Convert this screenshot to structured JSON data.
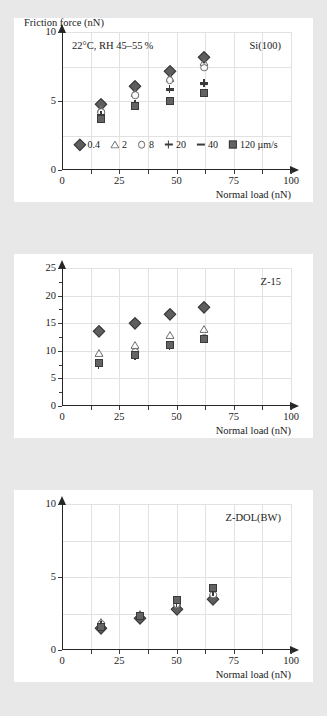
{
  "figure": {
    "background_color": "#e8e8e8",
    "panel_color": "#ffffff",
    "marker_color": "#5e5e5e"
  },
  "legend": {
    "title": "",
    "units": "µm/s",
    "entries": [
      {
        "label": "0.4",
        "marker": "diamond"
      },
      {
        "label": "2",
        "marker": "triangle"
      },
      {
        "label": "8",
        "marker": "circle"
      },
      {
        "label": "20",
        "marker": "plus"
      },
      {
        "label": "40",
        "marker": "dash"
      },
      {
        "label": "120 µm/s",
        "marker": "square"
      }
    ]
  },
  "axis_titles": {
    "y": "Friction force (nN)",
    "x": "Normal load (nN)"
  },
  "chart_data": [
    {
      "type": "scatter",
      "title": "Si(100)",
      "annotation": "22°C, RH 45–55 %",
      "xlabel": "Normal load (nN)",
      "ylabel": "Friction force (nN)",
      "xlim": [
        0,
        100
      ],
      "ylim": [
        0,
        10
      ],
      "xticks": [
        0,
        25,
        50,
        75,
        100
      ],
      "yticks": [
        0,
        5,
        10
      ],
      "grid": true,
      "legend_position": "inside-bottom-center",
      "series": [
        {
          "name": "0.4",
          "marker": "diamond",
          "x": [
            17,
            32,
            47,
            62
          ],
          "y": [
            4.8,
            6.1,
            7.2,
            8.2
          ]
        },
        {
          "name": "2",
          "marker": "triangle",
          "x": [
            17,
            32,
            47,
            62
          ],
          "y": [
            4.4,
            5.6,
            6.7,
            7.8
          ]
        },
        {
          "name": "8",
          "marker": "circle",
          "x": [
            17,
            32,
            47,
            62
          ],
          "y": [
            4.2,
            5.4,
            6.5,
            7.4
          ]
        },
        {
          "name": "20",
          "marker": "plus",
          "x": [
            17,
            32,
            47,
            62
          ],
          "y": [
            4.0,
            4.8,
            5.9,
            6.3
          ]
        },
        {
          "name": "40",
          "marker": "dash",
          "x": [
            17,
            32,
            47,
            62
          ],
          "y": [
            3.9,
            4.7,
            5.8,
            6.2
          ]
        },
        {
          "name": "120",
          "marker": "square",
          "x": [
            17,
            32,
            47,
            62
          ],
          "y": [
            3.7,
            4.65,
            5.0,
            5.6
          ]
        }
      ]
    },
    {
      "type": "scatter",
      "title": "Z-15",
      "annotation": "",
      "xlabel": "Normal load (nN)",
      "ylabel": "Friction force (nN)",
      "xlim": [
        0,
        100
      ],
      "ylim": [
        0,
        25
      ],
      "xticks": [
        0,
        25,
        50,
        75,
        100
      ],
      "yticks": [
        0,
        5,
        10,
        15,
        20,
        25
      ],
      "grid": true,
      "legend_position": "none",
      "series": [
        {
          "name": "0.4",
          "marker": "diamond",
          "x": [
            16,
            32,
            47,
            62
          ],
          "y": [
            13.6,
            15.1,
            16.6,
            18.0
          ]
        },
        {
          "name": "2",
          "marker": "triangle",
          "x": [
            16,
            32,
            47,
            62
          ],
          "y": [
            9.6,
            11.1,
            12.8,
            14.0
          ]
        },
        {
          "name": "8",
          "marker": "circle",
          "x": [
            16,
            32,
            47,
            62
          ],
          "y": [
            7.8,
            9.7,
            11.0,
            12.4
          ]
        },
        {
          "name": "20",
          "marker": "plus",
          "x": [
            16,
            32,
            47,
            62
          ],
          "y": [
            7.5,
            9.1,
            10.9,
            12.1
          ]
        },
        {
          "name": "40",
          "marker": "dash",
          "x": [
            16,
            32,
            47,
            62
          ],
          "y": [
            7.6,
            9.2,
            10.9,
            12.1
          ]
        },
        {
          "name": "120",
          "marker": "square",
          "x": [
            16,
            32,
            47,
            62
          ],
          "y": [
            7.7,
            9.2,
            11.0,
            12.1
          ]
        }
      ]
    },
    {
      "type": "scatter",
      "title": "Z-DOL(BW)",
      "annotation": "",
      "xlabel": "Normal load (nN)",
      "ylabel": "Friction force (nN)",
      "xlim": [
        0,
        100
      ],
      "ylim": [
        0,
        10
      ],
      "xticks": [
        0,
        25,
        50,
        75,
        100
      ],
      "yticks": [
        0,
        5,
        10
      ],
      "grid": true,
      "legend_position": "none",
      "series": [
        {
          "name": "0.4",
          "marker": "diamond",
          "x": [
            17,
            34,
            50,
            66
          ],
          "y": [
            1.5,
            2.2,
            2.8,
            3.5
          ]
        },
        {
          "name": "2",
          "marker": "triangle",
          "x": [
            17,
            34,
            50,
            66
          ],
          "y": [
            1.9,
            2.5,
            3.3,
            3.9
          ]
        },
        {
          "name": "8",
          "marker": "circle",
          "x": [
            17,
            34,
            50,
            66
          ],
          "y": [
            1.8,
            2.3,
            3.1,
            3.8
          ]
        },
        {
          "name": "20",
          "marker": "plus",
          "x": [
            17,
            34,
            50,
            66
          ],
          "y": [
            1.7,
            2.35,
            3.25,
            4.0
          ]
        },
        {
          "name": "40",
          "marker": "dash",
          "x": [
            17,
            34,
            50,
            66
          ],
          "y": [
            1.65,
            2.55,
            3.45,
            4.2
          ]
        },
        {
          "name": "120",
          "marker": "square",
          "x": [
            17,
            34,
            50,
            66
          ],
          "y": [
            1.55,
            2.3,
            3.4,
            4.25
          ]
        }
      ]
    }
  ]
}
